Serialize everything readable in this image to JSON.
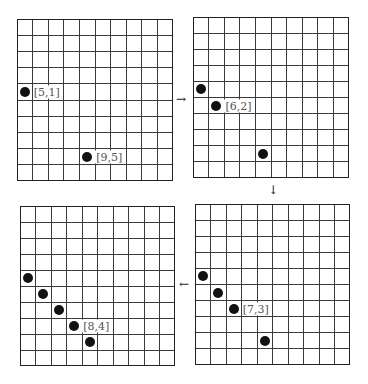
{
  "figure": {
    "grid_rows": 10,
    "grid_cols": 10,
    "line_color": "#3a3a3a",
    "border_color": "#222222",
    "dot_color": "#111111",
    "label_color": "#555555",
    "panels": [
      {
        "id": "panel-1",
        "position": "top-left",
        "box": {
          "x": 17,
          "y": 19,
          "w": 156,
          "h": 162
        },
        "dots": [
          {
            "row": 5,
            "col": 1,
            "label": "[5,1]"
          },
          {
            "row": 9,
            "col": 5,
            "label": "[9,5]"
          }
        ]
      },
      {
        "id": "panel-2",
        "position": "top-right",
        "box": {
          "x": 193,
          "y": 17,
          "w": 156,
          "h": 161
        },
        "dots": [
          {
            "row": 5,
            "col": 1,
            "label": ""
          },
          {
            "row": 6,
            "col": 2,
            "label": "[6,2]"
          },
          {
            "row": 9,
            "col": 5,
            "label": ""
          }
        ]
      },
      {
        "id": "panel-3",
        "position": "bottom-right",
        "box": {
          "x": 195,
          "y": 204,
          "w": 155,
          "h": 161
        },
        "dots": [
          {
            "row": 5,
            "col": 1,
            "label": ""
          },
          {
            "row": 6,
            "col": 2,
            "label": ""
          },
          {
            "row": 7,
            "col": 3,
            "label": "[7,3]"
          },
          {
            "row": 9,
            "col": 5,
            "label": ""
          }
        ]
      },
      {
        "id": "panel-4",
        "position": "bottom-left",
        "box": {
          "x": 20,
          "y": 206,
          "w": 155,
          "h": 160
        },
        "dots": [
          {
            "row": 5,
            "col": 1,
            "label": ""
          },
          {
            "row": 6,
            "col": 2,
            "label": ""
          },
          {
            "row": 7,
            "col": 3,
            "label": ""
          },
          {
            "row": 8,
            "col": 4,
            "label": "[8,4]"
          },
          {
            "row": 9,
            "col": 5,
            "label": ""
          }
        ]
      }
    ],
    "arrows": [
      {
        "from": "panel-1",
        "to": "panel-2",
        "glyph": "→",
        "x": 176,
        "y": 93
      },
      {
        "from": "panel-2",
        "to": "panel-3",
        "glyph": "↓",
        "x": 268,
        "y": 184
      },
      {
        "from": "panel-3",
        "to": "panel-4",
        "glyph": "←",
        "x": 179,
        "y": 278
      }
    ]
  }
}
